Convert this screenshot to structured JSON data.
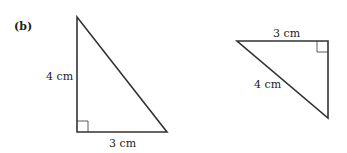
{
  "figure": {
    "part_label": "(b)",
    "triangle_left": {
      "vertical_side": "4 cm",
      "horizontal_side": "3 cm",
      "right_angle": "bottom-left"
    },
    "triangle_right": {
      "top_side": "3 cm",
      "hypotenuse": "4 cm",
      "right_angle": "top-right"
    }
  },
  "colors": {
    "line": "#333333",
    "text": "#222222"
  }
}
